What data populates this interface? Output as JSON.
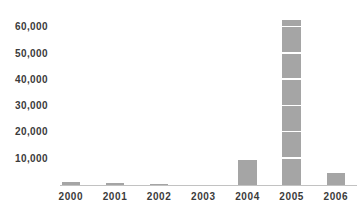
{
  "chart_data": {
    "type": "bar",
    "title": "",
    "xlabel": "",
    "ylabel": "",
    "categories": [
      "2000",
      "2001",
      "2002",
      "2003",
      "2004",
      "2005",
      "2006"
    ],
    "values": [
      1000,
      700,
      400,
      0,
      9500,
      63000,
      4500
    ],
    "ylim": [
      0,
      65000
    ],
    "yticks": [
      10000,
      20000,
      30000,
      40000,
      50000,
      60000
    ],
    "ytick_labels": [
      "10,000",
      "20,000",
      "30,000",
      "40,000",
      "50,000",
      "60,000"
    ],
    "grid": false,
    "legend": false,
    "bar_color": "#a5a5a5",
    "segmented_bars": [
      "2005"
    ],
    "segment_size": 10000,
    "segment_divider_color": "#ffffff"
  },
  "colors": {
    "background": "#ffffff",
    "text": "#3b3b3b",
    "axis_line": "#c2c2c2"
  }
}
